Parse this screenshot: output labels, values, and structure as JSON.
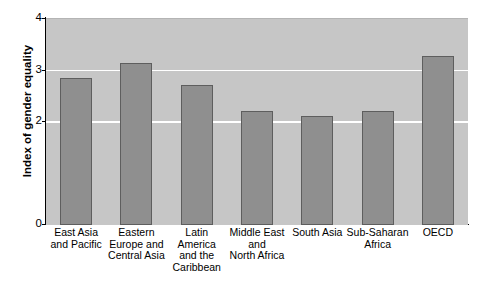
{
  "chart_data": {
    "type": "bar",
    "title": "",
    "xlabel": "",
    "ylabel": "Index of gender equality",
    "categories": [
      "East Asia and Pacific",
      "Eastern Europe and Central Asia",
      "Latin America and the Caribbean",
      "Middle East and North Africa",
      "South Asia",
      "Sub-Saharan Africa",
      "OECD"
    ],
    "category_lines": [
      [
        "East Asia",
        "and Pacific"
      ],
      [
        "Eastern",
        "Europe and",
        "Central Asia"
      ],
      [
        "Latin",
        "America",
        "and the",
        "Caribbean"
      ],
      [
        "Middle East",
        "and",
        "North Africa"
      ],
      [
        "South Asia"
      ],
      [
        "Sub-Saharan",
        "Africa"
      ],
      [
        "OECD"
      ]
    ],
    "values": [
      2.85,
      3.15,
      2.72,
      2.22,
      2.12,
      2.22,
      3.28
    ],
    "ylim": [
      0,
      4
    ],
    "ytick_values": [
      0,
      2,
      3,
      4
    ],
    "ytick_labels": [
      "0",
      "2",
      "3",
      "4"
    ],
    "gridlines_at": [
      2,
      3
    ],
    "grid": true,
    "legend": "none",
    "bar_color": "#8f8f8f",
    "bar_border_color": "#5e5e5e",
    "plot_background_color": "#c6c6c6",
    "gridline_color": "#ffffff",
    "axis_color": "#000000"
  }
}
